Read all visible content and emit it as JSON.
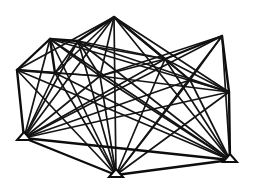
{
  "figure": {
    "background_color": "#ffffff",
    "stroke_color": "#141414",
    "canvas": {
      "width": 253,
      "height": 193
    }
  },
  "graph": {
    "node_count": 13,
    "edge_count": 62,
    "nodes": [
      {
        "id": "n0",
        "name": "peak-left",
        "x": 50,
        "y": 39,
        "marker": "none"
      },
      {
        "id": "n1",
        "name": "peak-center",
        "x": 114,
        "y": 17,
        "marker": "none"
      },
      {
        "id": "n2",
        "name": "peak-right",
        "x": 222,
        "y": 36,
        "marker": "none"
      },
      {
        "id": "n3",
        "name": "shoulder-far-left",
        "x": 17,
        "y": 70,
        "marker": "none"
      },
      {
        "id": "n4",
        "name": "shoulder-left",
        "x": 55,
        "y": 73,
        "marker": "none"
      },
      {
        "id": "n5",
        "name": "shoulder-center-left",
        "x": 78,
        "y": 41,
        "marker": "none"
      },
      {
        "id": "n6",
        "name": "shoulder-center-low",
        "x": 100,
        "y": 76,
        "marker": "none"
      },
      {
        "id": "n7",
        "name": "node-mid-right",
        "x": 165,
        "y": 59,
        "marker": "none"
      },
      {
        "id": "n8",
        "name": "node-right-inner",
        "x": 190,
        "y": 80,
        "marker": "none"
      },
      {
        "id": "n9",
        "name": "shoulder-far-right",
        "x": 229,
        "y": 92,
        "marker": "none"
      },
      {
        "id": "n10",
        "name": "hub-bottom-left",
        "x": 24,
        "y": 138,
        "marker": "triangle"
      },
      {
        "id": "n11",
        "name": "hub-bottom-center",
        "x": 116,
        "y": 175,
        "marker": "triangle"
      },
      {
        "id": "n12",
        "name": "hub-bottom-right",
        "x": 230,
        "y": 160,
        "marker": "triangle"
      }
    ],
    "edges": [
      [
        "n0",
        "n3"
      ],
      [
        "n0",
        "n4"
      ],
      [
        "n0",
        "n5"
      ],
      [
        "n0",
        "n10"
      ],
      [
        "n0",
        "n11"
      ],
      [
        "n0",
        "n6"
      ],
      [
        "n0",
        "n12"
      ],
      [
        "n0",
        "n9"
      ],
      [
        "n1",
        "n5"
      ],
      [
        "n1",
        "n6"
      ],
      [
        "n1",
        "n4"
      ],
      [
        "n1",
        "n7"
      ],
      [
        "n1",
        "n11"
      ],
      [
        "n1",
        "n10"
      ],
      [
        "n1",
        "n12"
      ],
      [
        "n1",
        "n8"
      ],
      [
        "n1",
        "n9"
      ],
      [
        "n1",
        "n3"
      ],
      [
        "n2",
        "n7"
      ],
      [
        "n2",
        "n8"
      ],
      [
        "n2",
        "n9"
      ],
      [
        "n2",
        "n12"
      ],
      [
        "n2",
        "n11"
      ],
      [
        "n2",
        "n10"
      ],
      [
        "n2",
        "n6"
      ],
      [
        "n3",
        "n4"
      ],
      [
        "n3",
        "n10"
      ],
      [
        "n3",
        "n6"
      ],
      [
        "n3",
        "n11"
      ],
      [
        "n4",
        "n10"
      ],
      [
        "n4",
        "n11"
      ],
      [
        "n4",
        "n6"
      ],
      [
        "n4",
        "n12"
      ],
      [
        "n5",
        "n6"
      ],
      [
        "n5",
        "n4"
      ],
      [
        "n5",
        "n10"
      ],
      [
        "n5",
        "n11"
      ],
      [
        "n5",
        "n7"
      ],
      [
        "n6",
        "n10"
      ],
      [
        "n6",
        "n11"
      ],
      [
        "n6",
        "n12"
      ],
      [
        "n6",
        "n7"
      ],
      [
        "n6",
        "n9"
      ],
      [
        "n7",
        "n8"
      ],
      [
        "n7",
        "n9"
      ],
      [
        "n7",
        "n10"
      ],
      [
        "n7",
        "n11"
      ],
      [
        "n7",
        "n12"
      ],
      [
        "n8",
        "n9"
      ],
      [
        "n8",
        "n11"
      ],
      [
        "n8",
        "n10"
      ],
      [
        "n8",
        "n12"
      ],
      [
        "n9",
        "n11"
      ],
      [
        "n9",
        "n12"
      ],
      [
        "n9",
        "n10"
      ],
      [
        "n10",
        "n11"
      ],
      [
        "n10",
        "n12"
      ],
      [
        "n11",
        "n12"
      ],
      [
        "n3",
        "n12"
      ],
      [
        "n5",
        "n12"
      ],
      [
        "n5",
        "n9"
      ],
      [
        "n0",
        "n7"
      ]
    ],
    "thick_edges": [
      [
        "n10",
        "n11"
      ],
      [
        "n11",
        "n12"
      ],
      [
        "n10",
        "n12"
      ],
      [
        "n0",
        "n3"
      ],
      [
        "n0",
        "n5"
      ],
      [
        "n1",
        "n5"
      ],
      [
        "n1",
        "n7"
      ],
      [
        "n2",
        "n7"
      ],
      [
        "n2",
        "n9"
      ],
      [
        "n3",
        "n10"
      ],
      [
        "n9",
        "n12"
      ],
      [
        "n0",
        "n4"
      ],
      [
        "n3",
        "n4"
      ]
    ]
  }
}
